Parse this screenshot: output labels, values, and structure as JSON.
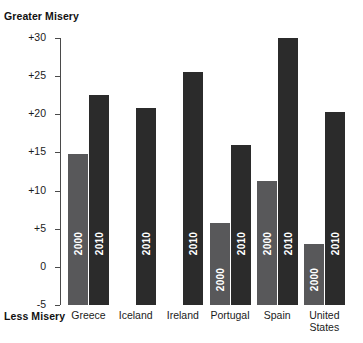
{
  "annotations": {
    "top_label": "Greater Misery",
    "bottom_label": "Less Misery"
  },
  "chart_data": {
    "type": "bar",
    "title": "",
    "subtitle": "",
    "xlabel": "",
    "ylabel": "",
    "ylim": [
      -5,
      30
    ],
    "yticks": [
      "-5",
      "0",
      "+5",
      "+10",
      "+15",
      "+20",
      "+25",
      "+30"
    ],
    "ytick_values": [
      -5,
      0,
      5,
      10,
      15,
      20,
      25,
      30
    ],
    "grid": false,
    "legend_position": "in-bar",
    "categories": [
      "Greece",
      "Iceland",
      "Ireland",
      "Portugal",
      "Spain",
      "United States"
    ],
    "series": [
      {
        "name": "2000",
        "color": "#58585a",
        "values": [
          14.8,
          -5.0,
          -5.0,
          5.8,
          11.3,
          3.0
        ]
      },
      {
        "name": "2010",
        "color": "#2b2b2b",
        "values": [
          22.5,
          20.8,
          25.5,
          16.0,
          30.0,
          20.3
        ]
      }
    ],
    "annotations": [
      "Greater Misery",
      "Less Misery"
    ]
  }
}
